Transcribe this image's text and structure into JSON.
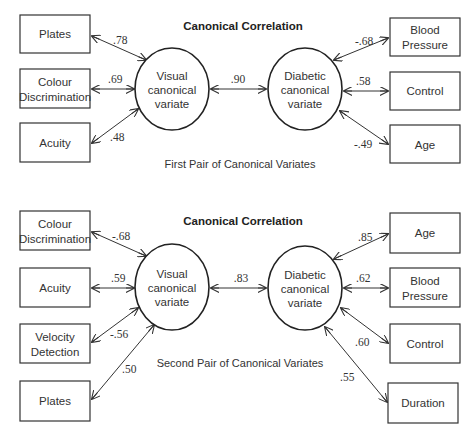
{
  "diagrams": [
    {
      "title": "Canonical Correlation",
      "caption": "First Pair of Canonical Variates",
      "left_variate": [
        "Visual",
        "canonical",
        "variate"
      ],
      "right_variate": [
        "Diabetic",
        "canonical",
        "variate"
      ],
      "canonical_correlation": ".90",
      "left_vars": [
        {
          "label": [
            "Plates"
          ],
          "loading": ".78"
        },
        {
          "label": [
            "Colour",
            "Discrimination"
          ],
          "loading": ".69"
        },
        {
          "label": [
            "Acuity"
          ],
          "loading": ".48"
        }
      ],
      "right_vars": [
        {
          "label": [
            "Blood",
            "Pressure"
          ],
          "loading": "-.68"
        },
        {
          "label": [
            "Control"
          ],
          "loading": ".58"
        },
        {
          "label": [
            "Age"
          ],
          "loading": "-.49"
        }
      ]
    },
    {
      "title": "Canonical Correlation",
      "caption": "Second Pair of Canonical Variates",
      "left_variate": [
        "Visual",
        "canonical",
        "variate"
      ],
      "right_variate": [
        "Diabetic",
        "canonical",
        "variate"
      ],
      "canonical_correlation": ".83",
      "left_vars": [
        {
          "label": [
            "Colour",
            "Discrimination"
          ],
          "loading": "-.68"
        },
        {
          "label": [
            "Acuity"
          ],
          "loading": ".59"
        },
        {
          "label": [
            "Velocity",
            "Detection"
          ],
          "loading": "-.56"
        },
        {
          "label": [
            "Plates"
          ],
          "loading": ".50"
        }
      ],
      "right_vars": [
        {
          "label": [
            "Age"
          ],
          "loading": ".85"
        },
        {
          "label": [
            "Blood",
            "Pressure"
          ],
          "loading": ".62"
        },
        {
          "label": [
            "Control"
          ],
          "loading": ".60"
        },
        {
          "label": [
            "Duration"
          ],
          "loading": ".55"
        }
      ]
    }
  ]
}
